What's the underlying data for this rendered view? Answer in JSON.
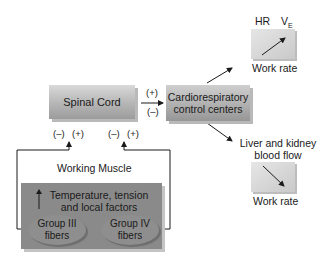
{
  "diagram": {
    "nodes": {
      "spinal_cord": "Spinal Cord",
      "cardio_line1": "Cardiorespiratory",
      "cardio_line2": "control centers",
      "working_muscle": "Working Muscle",
      "muscle_factors_line1": "Temperature, tension",
      "muscle_factors_line2": "and local factors",
      "group3_line1": "Group III",
      "group3_line2": "fibers",
      "group4_line1": "Group IV",
      "group4_line2": "fibers"
    },
    "signs": {
      "spinal_to_cardio_plus": "(+)",
      "spinal_to_cardio_minus": "(–)",
      "group3_minus": "(–)",
      "group3_plus": "(+)",
      "group4_minus": "(–)",
      "group4_plus": "(+)"
    },
    "outputs": {
      "top_graph": {
        "y_label_1": "HR",
        "y_label_2": "V",
        "y_label_2_sub": "E",
        "x_label": "Work rate",
        "trend": "increasing"
      },
      "liver_label_line1": "Liver and kidney",
      "liver_label_line2": "blood flow",
      "bottom_graph": {
        "x_label": "Work rate",
        "trend": "decreasing"
      }
    },
    "colors": {
      "box_gray": "#b0b0b0",
      "muscle_gray": "#8a8a8a",
      "line": "#1a1a1a"
    }
  }
}
